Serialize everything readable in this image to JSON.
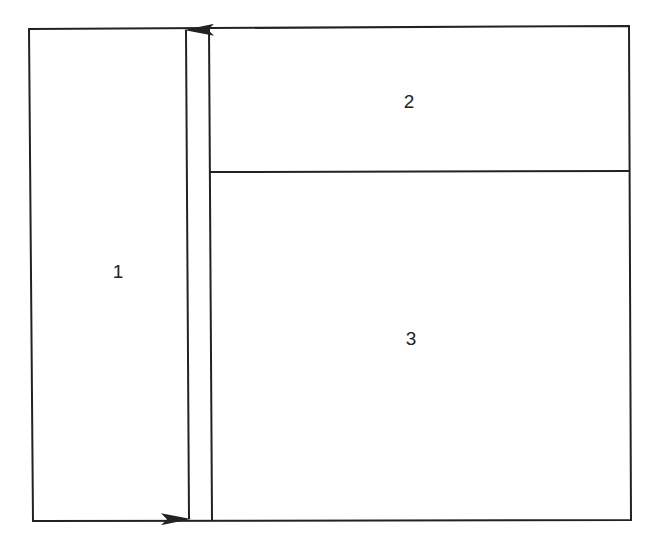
{
  "diagram": {
    "type": "layout-regions",
    "line_color": "#222222",
    "background": "#ffffff",
    "regions": [
      {
        "id": "region-1",
        "label": "1",
        "position": "left, full height"
      },
      {
        "id": "region-2",
        "label": "2",
        "position": "top right"
      },
      {
        "id": "region-3",
        "label": "3",
        "position": "bottom right"
      }
    ],
    "annotations": [
      {
        "id": "height-arrow",
        "type": "double-headed-arrow",
        "direction": "vertical",
        "meaning": "full height of region 1"
      }
    ]
  }
}
